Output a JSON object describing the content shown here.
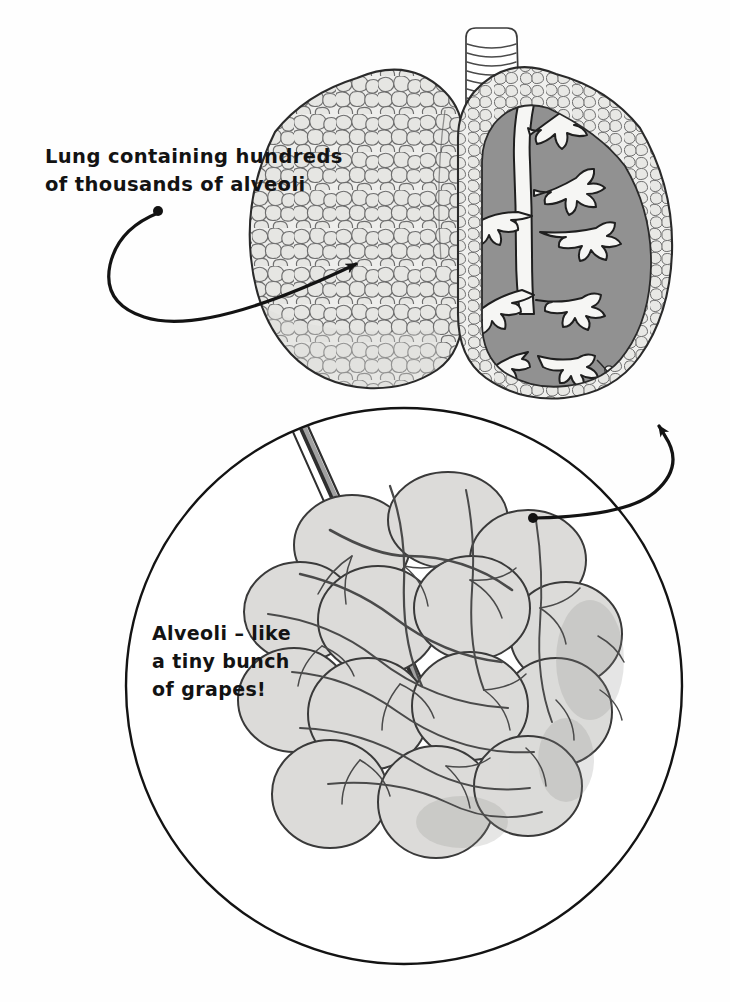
{
  "illustration": {
    "title": "Lungs and alveoli cutaway illustration",
    "style": "hand-drawn black and white anatomical diagram",
    "background_color": "#fefefe",
    "ink_color": "#131313"
  },
  "annotations": [
    {
      "id": "lung-label",
      "name": "lung-callout",
      "lines": [
        "Lung containing hundreds",
        "of thousands of alveoli"
      ],
      "line1": "Lung containing hundreds",
      "line2": "of thousands of alveoli",
      "text_x": 45,
      "text_y": 163,
      "dot": {
        "x": 158,
        "y": 211
      },
      "arrow_tip": {
        "x": 362,
        "y": 264
      }
    },
    {
      "id": "alveoli-label",
      "name": "alveoli-callout",
      "lines": [
        "Alveoli – like",
        "a tiny bunch",
        "of grapes!"
      ],
      "line1": "Alveoli – like",
      "line2": "a tiny bunch",
      "line3": "of grapes!",
      "text_x": 152,
      "text_y": 640,
      "dot": {
        "x": 533,
        "y": 518
      },
      "arrow_tip": {
        "x": 662,
        "y": 411
      }
    }
  ],
  "parts": {
    "trachea": {
      "label": "trachea",
      "rings": 22,
      "fill": "#ffffff",
      "stroke": "#3b3b3b"
    },
    "left_lung": {
      "label": "left lung with alveolar cobblestone texture",
      "fill": "#e9e9e7",
      "cell_stroke": "#6e6e6e",
      "outline": "#2a2a2a"
    },
    "right_lung": {
      "label": "right lung cutaway showing bronchial tree",
      "rim_fill": "#ededeb",
      "interior_fill": "#8e8e8e",
      "bronchi_fill": "#f7f7f5",
      "outline": "#2a2a2a"
    },
    "magnifier_circle": {
      "label": "magnification circle of alveolar sac cluster",
      "cx": 404,
      "cy": 686,
      "r": 279,
      "stroke": "#131313",
      "fill": "#ffffff"
    },
    "alveolar_cluster": {
      "label": "alveolar sacs like a bunch of grapes",
      "sac_fill": "#dcdbd9",
      "sac_stroke": "#3a3a3a",
      "capillary_color": "#4a4a4a",
      "bronchiole_color": "#2f2f2f"
    }
  },
  "colors": {
    "ink": "#131313",
    "light_gray": "#e9e9e7",
    "mid_gray": "#8e8e8e",
    "sac_gray": "#dcdbd9",
    "outline_gray": "#6e6e6e"
  }
}
